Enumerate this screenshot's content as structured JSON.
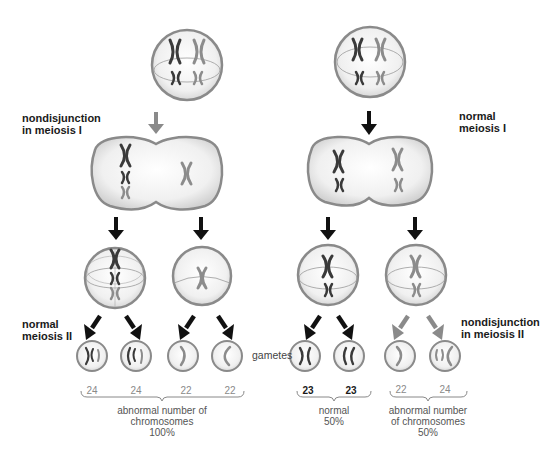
{
  "title": "Nondisjunction in meiosis",
  "colors": {
    "dark_chromosome": "#3a3a3a",
    "light_chromosome": "#8c8c8c",
    "black_arrow": "#111111",
    "grey_arrow": "#8a8a8a",
    "cell_outline": "#8a8a8a",
    "cell_fill": "#eeeeee"
  },
  "labels": {
    "nondisjunction_meiosis_1": "nondisjunction\nin meiosis I",
    "normal_meiosis_1": "normal\nmeiosis I",
    "normal_meiosis_2": "normal\nmeiosis II",
    "nondisjunction_meiosis_2": "nondisjunction\nin meiosis II",
    "gametes": "gametes"
  },
  "left_branch": {
    "process": "nondisjunction in meiosis I",
    "gametes": [
      {
        "chromosome_count": "24"
      },
      {
        "chromosome_count": "24"
      },
      {
        "chromosome_count": "22"
      },
      {
        "chromosome_count": "22"
      }
    ],
    "summary": "abnormal number of\nchromosomes\n100%"
  },
  "right_branch": {
    "process": "normal meiosis I",
    "normal_group": {
      "gametes": [
        {
          "chromosome_count": "23"
        },
        {
          "chromosome_count": "23"
        }
      ],
      "summary": "normal\n50%"
    },
    "abnormal_group": {
      "process": "nondisjunction in meiosis II",
      "gametes": [
        {
          "chromosome_count": "22"
        },
        {
          "chromosome_count": "24"
        }
      ],
      "summary": "abnormal number\nof chromosomes\n50%"
    }
  }
}
